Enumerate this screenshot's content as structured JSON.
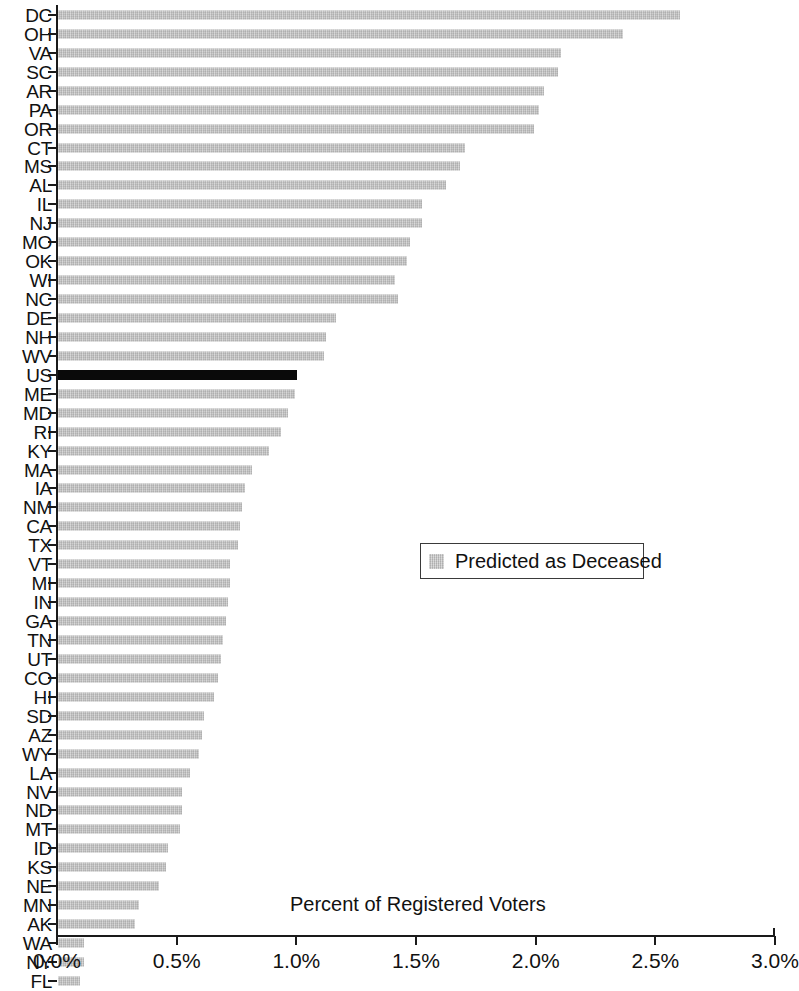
{
  "chart_data": {
    "type": "bar",
    "orientation": "horizontal",
    "title": "",
    "subtitle": "",
    "xlabel": "Percent of Registered Voters",
    "ylabel": "",
    "xlim": [
      0.0,
      3.0
    ],
    "xticks": [
      "0.0%",
      "0.5%",
      "1.0%",
      "1.5%",
      "2.0%",
      "2.5%",
      "3.0%"
    ],
    "xtick_values": [
      0.0,
      0.5,
      1.0,
      1.5,
      2.0,
      2.5,
      3.0
    ],
    "grid": false,
    "legend_position": "center-right",
    "legend": [
      {
        "label": "Predicted as Deceased",
        "color": "#bcbcbc"
      }
    ],
    "series_name": "Predicted as Deceased",
    "highlight_color": "#0a0a0a",
    "bar_color": "#bcbcbc",
    "highlighted_categories": [
      "US"
    ],
    "categories": [
      "DC",
      "OH",
      "VA",
      "SC",
      "AR",
      "PA",
      "OR",
      "CT",
      "MS",
      "AL",
      "IL",
      "NJ",
      "MO",
      "OK",
      "WI",
      "NC",
      "DE",
      "NH",
      "WV",
      "US",
      "ME",
      "MD",
      "RI",
      "KY",
      "MA",
      "IA",
      "NM",
      "CA",
      "TX",
      "VT",
      "MI",
      "IN",
      "GA",
      "TN",
      "UT",
      "CO",
      "HI",
      "SD",
      "AZ",
      "WY",
      "LA",
      "NV",
      "ND",
      "MT",
      "ID",
      "KS",
      "NE",
      "MN",
      "AK",
      "WA",
      "NY",
      "FL"
    ],
    "values": [
      2.6,
      2.36,
      2.1,
      2.09,
      2.03,
      2.01,
      1.99,
      1.7,
      1.68,
      1.62,
      1.52,
      1.52,
      1.47,
      1.46,
      1.41,
      1.42,
      1.16,
      1.12,
      1.11,
      1.0,
      0.99,
      0.96,
      0.93,
      0.88,
      0.81,
      0.78,
      0.77,
      0.76,
      0.75,
      0.72,
      0.72,
      0.71,
      0.7,
      0.69,
      0.68,
      0.67,
      0.65,
      0.61,
      0.6,
      0.59,
      0.55,
      0.52,
      0.52,
      0.51,
      0.46,
      0.45,
      0.42,
      0.34,
      0.32,
      0.11,
      0.11,
      0.09
    ]
  },
  "axis": {
    "x_title": "Percent of Registered Voters"
  }
}
